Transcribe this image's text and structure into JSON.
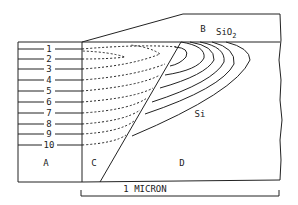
{
  "figure": {
    "regions": {
      "A": "A",
      "B": "B",
      "C": "C",
      "D": "D"
    },
    "materials": {
      "oxide": "SiO",
      "oxide_subscript": "2",
      "substrate": "Si"
    },
    "contour_labels": [
      "1",
      "2",
      "3",
      "4",
      "5",
      "6",
      "7",
      "8",
      "9",
      "10"
    ],
    "scale_bar": {
      "label": "1 MICRON"
    }
  },
  "colors": {
    "line": "#222222",
    "background": "#ffffff"
  }
}
